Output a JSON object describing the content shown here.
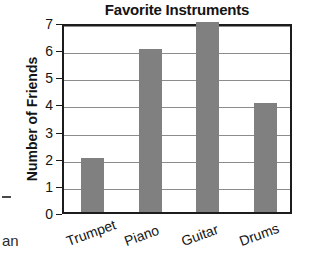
{
  "chart_data": {
    "type": "bar",
    "title": "Favorite Instruments",
    "xlabel": "",
    "ylabel": "Number of Friends",
    "categories": [
      "Trumpet",
      "Piano",
      "Guitar",
      "Drums"
    ],
    "values": [
      2,
      6,
      7,
      4
    ],
    "ylim": [
      0,
      7
    ],
    "ytick_labels": [
      "7",
      "6",
      "5",
      "4",
      "3",
      "2",
      "1",
      "0"
    ],
    "ytick_values": [
      7,
      6,
      5,
      4,
      3,
      2,
      1,
      0
    ],
    "grid": true,
    "grid_axis": "y",
    "legend": false,
    "bar_color": "#808080",
    "axis_color": "#1c1c1c",
    "grid_color": "#8c8c8c",
    "text_color": "#141414",
    "background": "#ffffff"
  },
  "artifacts": {
    "fragment_text": "an"
  }
}
